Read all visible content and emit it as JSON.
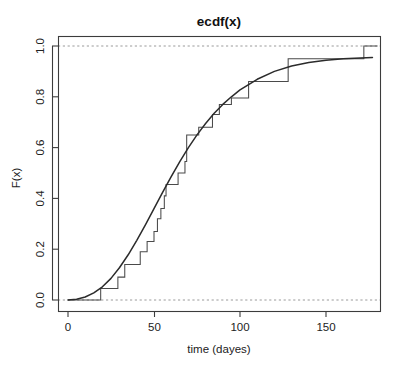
{
  "chart_data": {
    "type": "line",
    "title": "ecdf(x)",
    "xlabel": "time (dayes)",
    "ylabel": "F(x)",
    "xlim": [
      -8,
      183
    ],
    "ylim": [
      -0.04,
      1.04
    ],
    "grid": false,
    "legend": null,
    "xticks": [
      0,
      50,
      100,
      150
    ],
    "xticklabels": [
      "0",
      "50",
      "100",
      "150"
    ],
    "yticks": [
      0.0,
      0.2,
      0.4,
      0.6,
      0.8,
      1.0
    ],
    "yticklabels": [
      "0.0",
      "0.2",
      "0.4",
      "0.6",
      "0.8",
      "1.0"
    ],
    "reference_lines": [
      {
        "name": "y=0",
        "y": 0.0,
        "style": "dashed",
        "color": "#9a9a9a"
      },
      {
        "name": "y=1",
        "y": 1.0,
        "style": "dashed",
        "color": "#9a9a9a"
      }
    ],
    "series": [
      {
        "name": "ecdf step function",
        "type": "step",
        "color": "#4a4a4a",
        "x": [
          0,
          19,
          29,
          33,
          42,
          46,
          50,
          52,
          54,
          56,
          57,
          64,
          68,
          69,
          76,
          84,
          88,
          95,
          105,
          128,
          172,
          180
        ],
        "y": [
          0.0,
          0.045,
          0.09,
          0.14,
          0.19,
          0.23,
          0.27,
          0.32,
          0.36,
          0.41,
          0.455,
          0.5,
          0.545,
          0.65,
          0.68,
          0.73,
          0.77,
          0.795,
          0.86,
          0.95,
          1.0,
          1.0
        ]
      },
      {
        "name": "fitted distribution curve",
        "type": "line",
        "color": "#2b2b2b",
        "x": [
          0,
          5,
          10,
          15,
          20,
          25,
          30,
          35,
          40,
          45,
          50,
          55,
          60,
          65,
          70,
          75,
          80,
          85,
          90,
          95,
          100,
          110,
          120,
          130,
          140,
          150,
          160,
          170,
          177
        ],
        "y": [
          0.0,
          0.003,
          0.012,
          0.028,
          0.052,
          0.085,
          0.128,
          0.178,
          0.235,
          0.296,
          0.36,
          0.424,
          0.486,
          0.545,
          0.6,
          0.65,
          0.695,
          0.735,
          0.77,
          0.8,
          0.827,
          0.869,
          0.9,
          0.921,
          0.935,
          0.944,
          0.95,
          0.953,
          0.955
        ]
      }
    ]
  }
}
